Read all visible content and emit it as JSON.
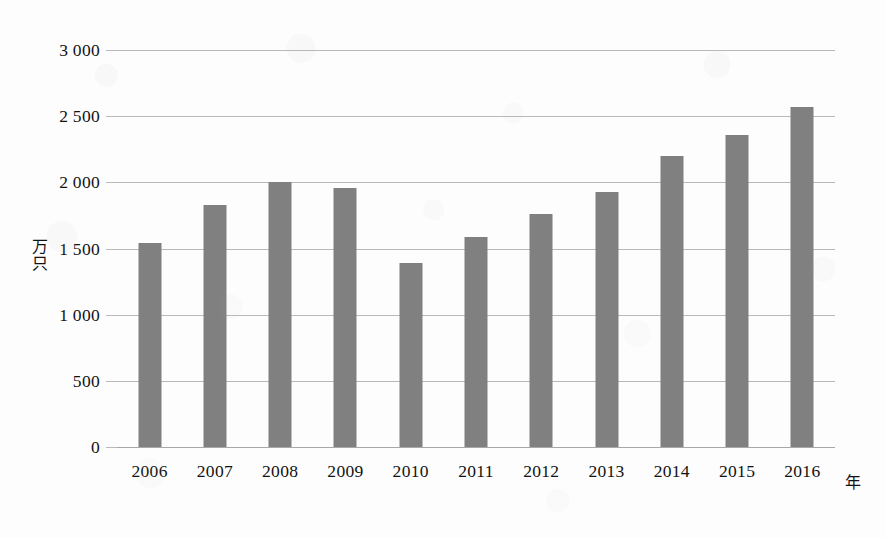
{
  "chart_data": {
    "type": "bar",
    "title": "",
    "subtitle": "",
    "xlabel": "年",
    "ylabel": "万只",
    "categories": [
      "2006",
      "2007",
      "2008",
      "2009",
      "2010",
      "2011",
      "2012",
      "2013",
      "2014",
      "2015",
      "2016"
    ],
    "values": [
      1540,
      1830,
      2000,
      1960,
      1390,
      1590,
      1760,
      1930,
      2200,
      2360,
      2570
    ],
    "series": [
      {
        "name": "",
        "values": [
          1540,
          1830,
          2000,
          1960,
          1390,
          1590,
          1760,
          1930,
          2200,
          2360,
          2570
        ]
      }
    ],
    "ylim": [
      0,
      3000
    ],
    "y_ticks": [
      0,
      500,
      1000,
      1500,
      2000,
      2500,
      3000
    ],
    "y_tick_labels": [
      "0",
      "500",
      "1 000",
      "1 500",
      "2 000",
      "2 500",
      "3 000"
    ],
    "grid": true,
    "legend": false,
    "legend_position": "none",
    "bar_color": "#808080",
    "grid_color": "#b9b9b9",
    "background_color": "#fdfdfd",
    "annotations": []
  }
}
